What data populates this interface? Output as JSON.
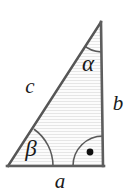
{
  "figure": {
    "kind": "right-triangle-geometry-diagram",
    "notation": "European (right angle marked by arc with centre dot)",
    "canvas": {
      "width": 136,
      "height": 194
    },
    "colors": {
      "background": "#ffffff",
      "stroke": "#555555",
      "fill": "#fbfbfb",
      "hatch": "#e3e3e3",
      "label": "#1a1a1a",
      "right_angle_dot": "#111111"
    },
    "vertices": {
      "apex": {
        "name": "A",
        "x": 101,
        "y": 22
      },
      "bottom_left": {
        "name": "B",
        "x": 8,
        "y": 166
      },
      "bottom_right": {
        "name": "C",
        "x": 103,
        "y": 166
      }
    },
    "sides": [
      {
        "id": "a",
        "label": "a",
        "from": "bottom_left",
        "to": "bottom_right",
        "role": "base",
        "label_x": 60,
        "label_y": 181
      },
      {
        "id": "b",
        "label": "b",
        "from": "apex",
        "to": "bottom_right",
        "role": "vertical-leg",
        "label_x": 118,
        "label_y": 103
      },
      {
        "id": "c",
        "label": "c",
        "from": "bottom_left",
        "to": "apex",
        "role": "hypotenuse",
        "label_x": 30,
        "label_y": 86
      }
    ],
    "angles": [
      {
        "id": "alpha",
        "label": "α",
        "at": "apex",
        "arc_radius": 30,
        "label_x": 88,
        "label_y": 63,
        "is_right_angle": false
      },
      {
        "id": "beta",
        "label": "β",
        "at": "bottom_left",
        "arc_radius": 45,
        "label_x": 31,
        "label_y": 148,
        "is_right_angle": false
      },
      {
        "id": "gamma",
        "label": "⋅",
        "at": "bottom_right",
        "arc_radius": 30,
        "label_x": 90,
        "label_y": 152,
        "is_right_angle": true
      }
    ],
    "interior": {
      "hatching": "horizontal-lines",
      "hatch_spacing_px": 3
    }
  }
}
